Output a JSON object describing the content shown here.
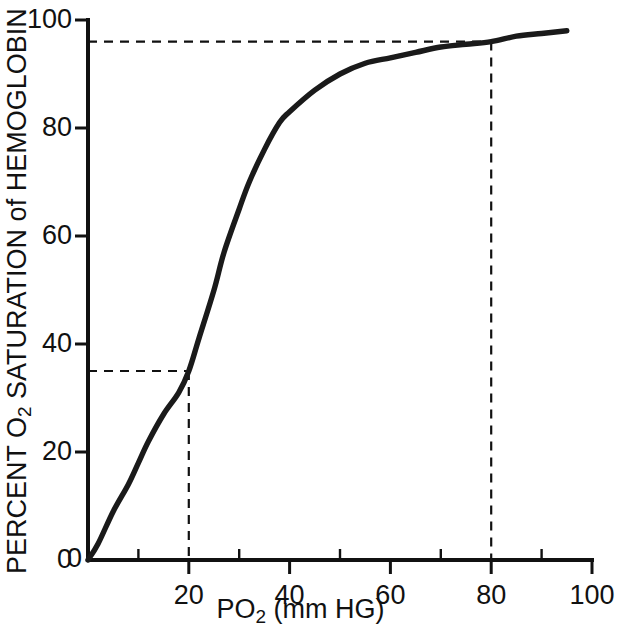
{
  "chart_data": {
    "type": "line",
    "title": "",
    "xlabel": "PO2 (mm HG)",
    "xlabel_main": "PO",
    "xlabel_sub": "2",
    "xlabel_tail": " (mm HG)",
    "ylabel": "PERCENT O2 SATURATION of HEMOGLOBIN (Hb)",
    "ylabel_part1": "PERCENT O",
    "ylabel_sub": "2",
    "ylabel_part2": " SATURATION of HEMOGLOBIN (Hb)",
    "xlim": [
      0,
      100
    ],
    "ylim": [
      0,
      100
    ],
    "grid": false,
    "legend": "none",
    "xticks": [
      0,
      20,
      40,
      60,
      80,
      100
    ],
    "xtick_labels": [
      "0",
      "20",
      "40",
      "60",
      "80",
      "100"
    ],
    "x_minor_ticks": [
      10,
      30,
      50,
      70,
      90
    ],
    "yticks": [
      0,
      20,
      40,
      60,
      80,
      100
    ],
    "ytick_labels": [
      "0",
      "20",
      "40",
      "60",
      "80",
      "100"
    ],
    "series": [
      {
        "name": "Oxygen-hemoglobin dissociation curve",
        "color": "#1a1a1a",
        "x": [
          0,
          2,
          5,
          8,
          10,
          12,
          15,
          18,
          20,
          22,
          25,
          27,
          30,
          32,
          35,
          38,
          40,
          45,
          50,
          55,
          60,
          65,
          70,
          75,
          80,
          85,
          90,
          95
        ],
        "y": [
          0,
          3,
          9,
          14,
          18,
          22,
          27,
          31,
          35,
          41,
          50,
          57,
          65,
          70,
          76,
          81,
          83,
          87,
          90,
          92,
          93,
          94,
          95,
          95.5,
          96,
          97,
          97.5,
          98
        ]
      }
    ],
    "reference_lines": [
      {
        "name": "arterial-reference",
        "x": 80,
        "y": 96,
        "style": "dashed",
        "label": ""
      },
      {
        "name": "venous-reference",
        "x": 20,
        "y": 35,
        "style": "dashed",
        "label": ""
      }
    ],
    "annotations": []
  }
}
